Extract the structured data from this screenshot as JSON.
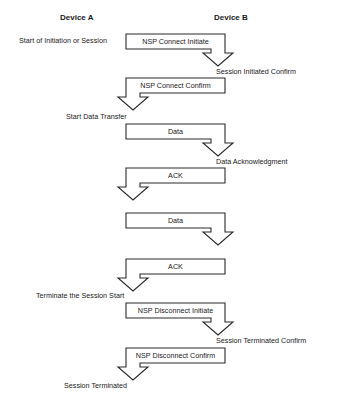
{
  "headers": {
    "device_a": "Device A",
    "device_b": "Device B"
  },
  "labels": [
    {
      "id": "start-initiation",
      "text": "Start of Initiation or Session",
      "x": 19,
      "y": 36,
      "side": "A"
    },
    {
      "id": "session-initiated-confirm",
      "text": "Session Initiated Confirm",
      "x": 216,
      "y": 67,
      "side": "B"
    },
    {
      "id": "start-data-transfer",
      "text": "Start Data Transfer",
      "x": 66,
      "y": 112,
      "side": "A"
    },
    {
      "id": "data-acknowledgment",
      "text": "Data Acknowledgment",
      "x": 216,
      "y": 157,
      "side": "B"
    },
    {
      "id": "terminate-session-start",
      "text": "Terminate the Session Start",
      "x": 36,
      "y": 291,
      "side": "A"
    },
    {
      "id": "session-terminated-confirm",
      "text": "Session Terminated Confirm",
      "x": 216,
      "y": 336,
      "side": "B"
    },
    {
      "id": "session-terminated",
      "text": "Session Terminated",
      "x": 64,
      "y": 381,
      "side": "A"
    }
  ],
  "messages": [
    {
      "id": "nsp-connect-initiate",
      "text": "NSP Connect Initiate",
      "direction": "A-to-B",
      "left": 126,
      "right": 225,
      "top": 34
    },
    {
      "id": "nsp-connect-confirm",
      "text": "NSP Connect Confirm",
      "direction": "B-to-A",
      "left": 126,
      "right": 225,
      "top": 78
    },
    {
      "id": "data-1",
      "text": "Data",
      "direction": "A-to-B",
      "left": 126,
      "right": 225,
      "top": 124
    },
    {
      "id": "ack-1",
      "text": "ACK",
      "direction": "B-to-A",
      "left": 126,
      "right": 225,
      "top": 168
    },
    {
      "id": "data-2",
      "text": "Data",
      "direction": "A-to-B",
      "left": 126,
      "right": 225,
      "top": 213
    },
    {
      "id": "ack-2",
      "text": "ACK",
      "direction": "B-to-A",
      "left": 126,
      "right": 225,
      "top": 259
    },
    {
      "id": "nsp-disconnect-initiate",
      "text": "NSP Disconnect Initiate",
      "direction": "A-to-B",
      "left": 126,
      "right": 225,
      "top": 303
    },
    {
      "id": "nsp-disconnect-confirm",
      "text": "NSP Disconnect Confirm",
      "direction": "B-to-A",
      "left": 126,
      "right": 225,
      "top": 348
    }
  ],
  "style": {
    "stroke": "#2a2a2a",
    "fill": "#ffffff",
    "text": "#1a1a1a"
  }
}
